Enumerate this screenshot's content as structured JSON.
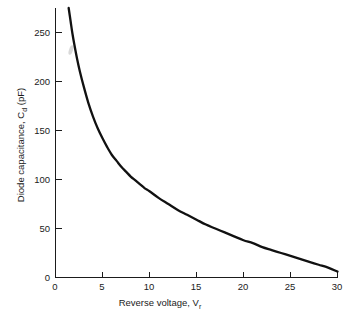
{
  "chart_data": {
    "type": "line",
    "title": "",
    "xlabel": "Reverse voltage, V",
    "xlabel_sub": "r",
    "ylabel": "Diode capacitance, C",
    "ylabel_sub": "d",
    "ylabel_unit": " (pF)",
    "xlim": [
      0,
      30
    ],
    "ylim": [
      0,
      275
    ],
    "xticks": [
      0,
      5,
      10,
      15,
      20,
      25,
      30
    ],
    "xticklabels": [
      "0",
      "5",
      "10",
      "15",
      "20",
      "25",
      "30"
    ],
    "yticks": [
      0,
      50,
      100,
      150,
      200,
      250
    ],
    "yticklabels": [
      "0",
      "50",
      "100",
      "150",
      "200",
      "250"
    ],
    "grid": false,
    "legend": false,
    "series": [
      {
        "name": "Diode capacitance",
        "color": "#111111",
        "x": [
          1.4,
          1.6,
          1.8,
          2.0,
          2.3,
          2.6,
          3.0,
          3.5,
          4.0,
          4.5,
          5.0,
          5.5,
          6.0,
          6.5,
          7.0,
          7.5,
          8.0,
          8.5,
          9.0,
          9.5,
          10.0,
          11.0,
          12.0,
          13.0,
          14.0,
          15.0,
          16.0,
          17.0,
          18.0,
          19.0,
          20.0,
          21.0,
          22.0,
          23.0,
          24.0,
          25.0,
          26.0,
          27.0,
          28.0,
          29.0,
          30.0
        ],
        "y": [
          275,
          262,
          249,
          238,
          223,
          210,
          195,
          178,
          164,
          152,
          142,
          133,
          125,
          119,
          113,
          108,
          103,
          99,
          95,
          91,
          88,
          81,
          75,
          69,
          64,
          59,
          54,
          50,
          46,
          42,
          38,
          35,
          31,
          28,
          25,
          22,
          19,
          16,
          13,
          10,
          6
        ]
      }
    ],
    "annotations": [
      {
        "name": "paper-smudge",
        "x": 1.7,
        "y": 232
      }
    ],
    "colors": {
      "curve": "#111111",
      "axis": "#1b1b1b",
      "background": "#ffffff"
    }
  }
}
